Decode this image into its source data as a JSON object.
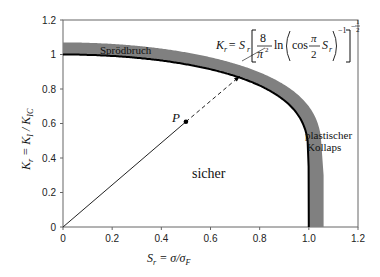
{
  "chart_data": {
    "type": "line",
    "title": "",
    "xlabel": "S_r = σ/σ_F",
    "ylabel": "K_r = K_I / K_IC",
    "xlim": [
      0,
      1.2
    ],
    "ylim": [
      0,
      1.2
    ],
    "grid": false,
    "x_ticks": [
      "0",
      "0.2",
      "0.4",
      "0.6",
      "0.8",
      "1.0",
      "1.2"
    ],
    "y_ticks": [
      "0",
      "0.2",
      "0.4",
      "0.6",
      "0.8",
      "1",
      "1.2"
    ],
    "series": [
      {
        "name": "Grenzkurve K_r = S_r[(8/π²) ln(cos(π/2 S_r))^-1]^-1/2",
        "x": [
          0.0,
          0.1,
          0.3,
          0.5,
          0.6,
          0.7,
          0.8,
          0.9,
          0.95,
          0.99,
          1.0
        ],
        "y": [
          1.0,
          0.998,
          0.981,
          0.943,
          0.914,
          0.875,
          0.82,
          0.734,
          0.661,
          0.54,
          0.0
        ]
      }
    ],
    "band": {
      "name": "Streuband",
      "offset": 0.07,
      "color": "#7f7f7f"
    },
    "load_path": {
      "from": [
        0,
        0
      ],
      "point_P": [
        0.5,
        0.61
      ],
      "to_curve": [
        0.72,
        0.875
      ]
    },
    "annotations": [
      {
        "text": "Sprödbruch",
        "x": 0.12,
        "y": 1.03
      },
      {
        "text": "plastischer",
        "x": 0.96,
        "y": 0.6
      },
      {
        "text": "Kollaps",
        "x": 0.97,
        "y": 0.53
      },
      {
        "text": "sicher",
        "x": 0.55,
        "y": 0.4
      },
      {
        "text": "P",
        "x": 0.46,
        "y": 0.64
      }
    ]
  },
  "labels": {
    "x_axis_label_main": "S",
    "x_axis_label_sub": "r",
    "x_axis_label_rest": " = σ/σ",
    "x_axis_label_sub2": "F",
    "y_axis_label_main": "K",
    "y_axis_label_sub": "r",
    "y_axis_label_rest": " = K",
    "y_axis_label_sub2": "I",
    "y_axis_label_rest2": " / K",
    "y_axis_label_sub3": "IC",
    "region_brittle": "Sprödbruch",
    "region_collapse_1": "plastischer",
    "region_collapse_2": "Kollaps",
    "region_safe": "sicher",
    "point_P": "P",
    "formula_lhs": "K",
    "formula_lhs_sub": "r",
    "formula_eq": " = S",
    "formula_eq_sub": "r",
    "formula_num": "8",
    "formula_den": "π",
    "formula_den_sup": "2",
    "formula_ln": "ln",
    "formula_cos": "cos",
    "formula_pi": "π",
    "formula_two": "2",
    "formula_S": "S",
    "formula_S_sub": "r",
    "formula_exp_inner": "−1",
    "formula_exp_outer_num": "1",
    "formula_exp_outer_den": "2",
    "formula_exp_outer_minus": "−"
  },
  "colors": {
    "axis": "#555555",
    "curve": "#000000",
    "band": "#808080",
    "line": "#222222"
  }
}
